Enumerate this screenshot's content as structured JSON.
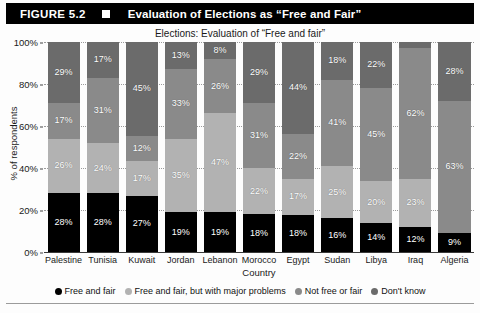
{
  "figure": {
    "number_label": "FIGURE 5.2",
    "marker_icon": "white-square-icon",
    "title": "Evaluation of Elections as “Free and Fair”"
  },
  "chart_data": {
    "type": "bar",
    "stacked": true,
    "title": "Elections: Evaluation of “Free and fair”",
    "xlabel": "Country",
    "ylabel": "% of respondents",
    "ylim": [
      0,
      100
    ],
    "yticks": [
      "0%",
      "20%",
      "40%",
      "60%",
      "80%",
      "100%"
    ],
    "grid": true,
    "legend_position": "bottom",
    "categories": [
      "Palestine",
      "Tunisia",
      "Kuwait",
      "Jordan",
      "Lebanon",
      "Morocco",
      "Egypt",
      "Sudan",
      "Libya",
      "Iraq",
      "Algeria"
    ],
    "series": [
      {
        "name": "Free and fair",
        "color": "#000000",
        "values": [
          28,
          28,
          27,
          19,
          19,
          18,
          18,
          16,
          14,
          12,
          9
        ],
        "labels": [
          "28%",
          "28%",
          "27%",
          "19%",
          "19%",
          "18%",
          "18%",
          "16%",
          "14%",
          "12%",
          "9%"
        ]
      },
      {
        "name": "Free and fair, but with major problems",
        "color": "#b2b2b2",
        "values": [
          26,
          24,
          17,
          35,
          47,
          22,
          17,
          25,
          20,
          23,
          0
        ],
        "labels": [
          "26%",
          "24%",
          "17%",
          "35%",
          "47%",
          "22%",
          "17%",
          "25%",
          "20%",
          "23%",
          ""
        ]
      },
      {
        "name": "Not free or fair",
        "color": "#8a8a8a",
        "values": [
          17,
          31,
          12,
          33,
          26,
          31,
          22,
          41,
          45,
          62,
          63
        ],
        "labels": [
          "17%",
          "31%",
          "12%",
          "33%",
          "26%",
          "31%",
          "22%",
          "41%",
          "45%",
          "62%",
          "63%"
        ]
      },
      {
        "name": "Don’t know",
        "color": "#6b6b6b",
        "values": [
          29,
          17,
          45,
          13,
          8,
          29,
          44,
          18,
          22,
          3,
          28
        ],
        "labels": [
          "29%",
          "17%",
          "45%",
          "13%",
          "8%",
          "29%",
          "44%",
          "18%",
          "22%",
          "",
          "28%"
        ]
      }
    ]
  },
  "legend": {
    "items": [
      {
        "label": "Free and fair",
        "color": "#000000",
        "icon": "legend-dot-icon"
      },
      {
        "label": "Free and fair, but with major problems",
        "color": "#b2b2b2",
        "icon": "legend-dot-icon"
      },
      {
        "label": "Not free or fair",
        "color": "#8a8a8a",
        "icon": "legend-dot-icon"
      },
      {
        "label": "Don't know",
        "color": "#6b6b6b",
        "icon": "legend-dot-icon"
      }
    ]
  }
}
